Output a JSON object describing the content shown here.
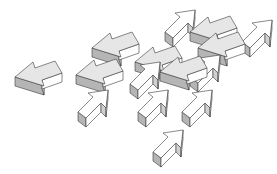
{
  "illustration": {
    "title": "3D arrows pointing in different directions",
    "background": "#ffffff",
    "colors": {
      "top_light": "#e6e6e6",
      "top_white": "#ffffff",
      "side_dark": "#b5b5b5",
      "side_mid": "#d0d0d0",
      "stroke": "#3a3a3a"
    },
    "arrows": [
      {
        "id": "left-large",
        "direction": "left",
        "tip": [
          15,
          77
        ],
        "top": "#e6e6e6"
      },
      {
        "id": "left-mid-1",
        "direction": "left",
        "tip": [
          76,
          75
        ],
        "top": "#e6e6e6"
      },
      {
        "id": "left-upper",
        "direction": "left",
        "tip": [
          92,
          48
        ],
        "top": "#e6e6e6"
      },
      {
        "id": "left-center",
        "direction": "left",
        "tip": [
          135,
          62
        ],
        "top": "#e6e6e6"
      },
      {
        "id": "left-center-right",
        "direction": "left",
        "tip": [
          160,
          72
        ],
        "top": "#e6e6e6"
      },
      {
        "id": "left-top-right",
        "direction": "left",
        "tip": [
          190,
          32
        ],
        "top": "#e6e6e6"
      },
      {
        "id": "left-right-2",
        "direction": "left",
        "tip": [
          198,
          48
        ],
        "top": "#e6e6e6"
      },
      {
        "id": "up-right-top",
        "direction": "up-right",
        "tip": [
          195,
          10
        ],
        "top": "#ffffff"
      },
      {
        "id": "up-right-far",
        "direction": "up-right",
        "tip": [
          272,
          20
        ],
        "top": "#ffffff"
      },
      {
        "id": "up-right-1",
        "direction": "up-right",
        "tip": [
          108,
          90
        ],
        "top": "#ffffff"
      },
      {
        "id": "up-right-2",
        "direction": "up-right",
        "tip": [
          168,
          90
        ],
        "top": "#ffffff"
      },
      {
        "id": "up-right-3",
        "direction": "up-right",
        "tip": [
          212,
          90
        ],
        "top": "#ffffff"
      },
      {
        "id": "up-right-bottom",
        "direction": "up-right",
        "tip": [
          183,
          130
        ],
        "top": "#ffffff"
      },
      {
        "id": "up-right-mid",
        "direction": "up-right",
        "tip": [
          160,
          62
        ],
        "top": "#ffffff"
      },
      {
        "id": "up-right-mid-2",
        "direction": "up-right",
        "tip": [
          220,
          55
        ],
        "top": "#ffffff"
      }
    ]
  }
}
